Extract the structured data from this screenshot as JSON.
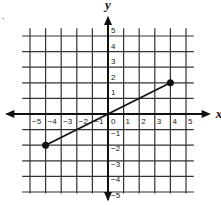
{
  "chart_data": {
    "type": "line",
    "title": "",
    "xlabel": "x",
    "ylabel": "y",
    "xlim": [
      -5,
      5
    ],
    "ylim": [
      -5,
      5
    ],
    "grid": true,
    "x_ticks": [
      -5,
      -4,
      -3,
      -2,
      -1,
      0,
      1,
      2,
      3,
      4,
      5
    ],
    "y_ticks": [
      -5,
      -4,
      -3,
      -2,
      -1,
      1,
      2,
      3,
      4,
      5
    ],
    "x_tick_labels": [
      "−5",
      "−4",
      "−3",
      "−2",
      "−1",
      "0",
      "1",
      "2",
      "3",
      "4",
      "5"
    ],
    "y_tick_labels": [
      "−5",
      "−4",
      "−3",
      "−2",
      "−1",
      "1",
      "2",
      "3",
      "4",
      "5"
    ],
    "series": [
      {
        "name": "segment",
        "x": [
          -4,
          4
        ],
        "y": [
          -2,
          2
        ],
        "endpoints": "filled-dots"
      }
    ]
  },
  "marker": "."
}
